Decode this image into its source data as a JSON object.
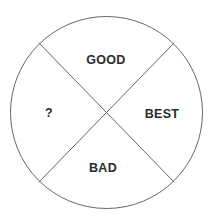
{
  "diagram": {
    "type": "quadrant-circle",
    "stroke_color": "#666666",
    "text_color": "#2b2b2b",
    "circle": {
      "cx": 106.5,
      "cy": 112.5,
      "r": 96
    },
    "quadrants": {
      "top": {
        "label": "GOOD",
        "x": 106,
        "y": 63.5
      },
      "left": {
        "label": "?",
        "x": 49,
        "y": 117
      },
      "right": {
        "label": "BEST",
        "x": 162,
        "y": 118
      },
      "bottom": {
        "label": "BAD",
        "x": 103,
        "y": 172
      }
    }
  }
}
